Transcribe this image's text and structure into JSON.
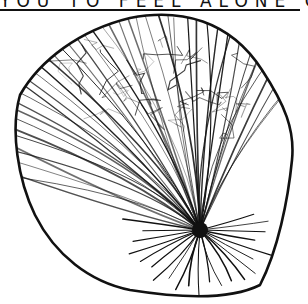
{
  "caption": {
    "text": "YOU TO FEEL ALONE OR"
  },
  "illustration": {
    "subject": "coconut-sketch",
    "ink_color": "#111111",
    "paper_color": "#ffffff"
  }
}
